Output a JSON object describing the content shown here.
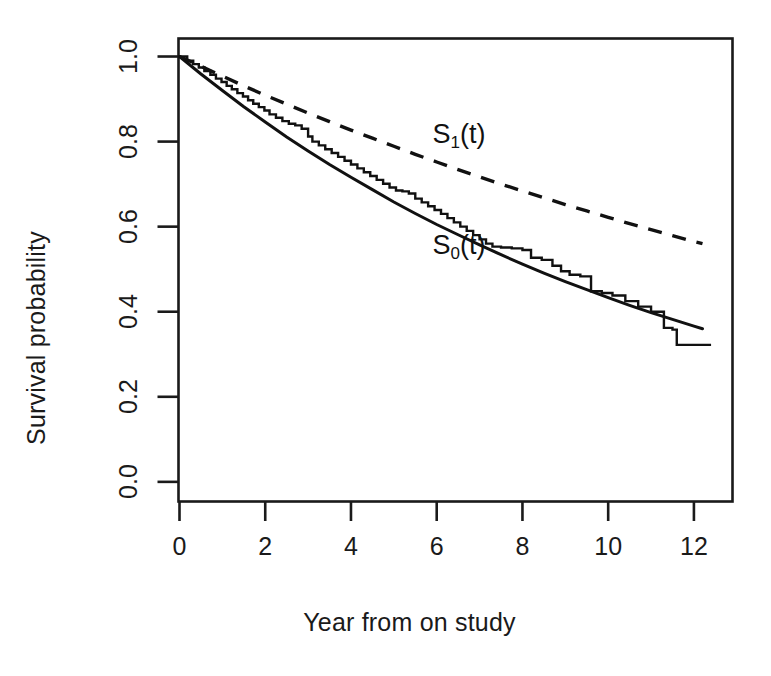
{
  "figure": {
    "background": "#ffffff",
    "ink_color": "#1a1a1a"
  },
  "axes": {
    "x_title": "Year from on study",
    "y_title": "Survival probability",
    "x_ticks": [
      "0",
      "2",
      "4",
      "6",
      "8",
      "10",
      "12"
    ],
    "y_ticks": [
      "0.0",
      "0.2",
      "0.4",
      "0.6",
      "0.8",
      "1.0"
    ]
  },
  "annotations": {
    "s1_label_base": "S",
    "s1_label_sub": "1",
    "s1_label_tail": "(t)",
    "s0_label_base": "S",
    "s0_label_sub": "0",
    "s0_label_tail": "(t)"
  },
  "chart_data": {
    "type": "line",
    "title": "",
    "xlabel": "Year from on study",
    "ylabel": "Survival probability",
    "xlim": [
      0,
      12.9
    ],
    "ylim": [
      -0.045,
      1.04
    ],
    "x_ticks": [
      0,
      2,
      4,
      6,
      8,
      10,
      12
    ],
    "y_ticks": [
      0.0,
      0.2,
      0.4,
      0.6,
      0.8,
      1.0
    ],
    "grid": false,
    "legend": "none",
    "box": true,
    "series": [
      {
        "name": "S1(t)",
        "style": "dashed",
        "color": "#111111",
        "label": "S_1(t)",
        "label_position": {
          "x": 5.9,
          "y": 0.805
        },
        "x": [
          0,
          0.5,
          1,
          1.5,
          2,
          2.5,
          3,
          3.5,
          4,
          4.5,
          5,
          5.5,
          6,
          6.5,
          7,
          7.5,
          8,
          8.5,
          9,
          9.5,
          10,
          10.5,
          11,
          11.5,
          12,
          12.2
        ],
        "y": [
          1.0,
          0.977,
          0.954,
          0.931,
          0.909,
          0.888,
          0.867,
          0.847,
          0.827,
          0.808,
          0.789,
          0.77,
          0.752,
          0.734,
          0.717,
          0.7,
          0.684,
          0.668,
          0.652,
          0.637,
          0.622,
          0.607,
          0.593,
          0.579,
          0.565,
          0.56
        ]
      },
      {
        "name": "S0(t)",
        "style": "solid",
        "color": "#111111",
        "label": "S_0(t)",
        "label_position": {
          "x": 5.9,
          "y": 0.545
        },
        "x": [
          0,
          0.5,
          1,
          1.5,
          2,
          2.5,
          3,
          3.5,
          4,
          4.5,
          5,
          5.5,
          6,
          6.5,
          7,
          7.5,
          8,
          8.5,
          9,
          9.5,
          10,
          10.5,
          11,
          11.5,
          12,
          12.2
        ],
        "y": [
          1.0,
          0.959,
          0.92,
          0.882,
          0.846,
          0.811,
          0.778,
          0.746,
          0.716,
          0.687,
          0.658,
          0.631,
          0.605,
          0.581,
          0.557,
          0.534,
          0.512,
          0.491,
          0.471,
          0.452,
          0.433,
          0.415,
          0.398,
          0.382,
          0.366,
          0.36
        ]
      },
      {
        "name": "Kaplan-Meier estimate",
        "style": "step",
        "color": "#111111",
        "x": [
          0,
          0.18,
          0.32,
          0.45,
          0.58,
          0.72,
          0.85,
          0.98,
          1.1,
          1.22,
          1.35,
          1.48,
          1.6,
          1.72,
          1.85,
          1.98,
          2.1,
          2.25,
          2.4,
          2.55,
          2.7,
          2.85,
          3.0,
          3.1,
          3.25,
          3.4,
          3.55,
          3.7,
          3.85,
          4.0,
          4.15,
          4.3,
          4.45,
          4.6,
          4.75,
          4.9,
          5.05,
          5.2,
          5.35,
          5.5,
          5.65,
          5.8,
          5.95,
          6.1,
          6.25,
          6.4,
          6.55,
          6.7,
          6.85,
          7.0,
          7.15,
          7.3,
          7.5,
          7.75,
          8.0,
          8.2,
          8.45,
          8.7,
          8.9,
          9.1,
          9.35,
          9.6,
          9.85,
          10.1,
          10.4,
          10.7,
          11.0,
          11.3,
          11.5,
          11.6,
          12.4
        ],
        "y": [
          1.0,
          0.99,
          0.982,
          0.974,
          0.966,
          0.957,
          0.948,
          0.94,
          0.931,
          0.923,
          0.914,
          0.906,
          0.897,
          0.889,
          0.881,
          0.873,
          0.864,
          0.856,
          0.848,
          0.842,
          0.838,
          0.83,
          0.812,
          0.8,
          0.791,
          0.782,
          0.773,
          0.764,
          0.755,
          0.746,
          0.737,
          0.728,
          0.719,
          0.71,
          0.701,
          0.692,
          0.685,
          0.683,
          0.678,
          0.666,
          0.657,
          0.648,
          0.639,
          0.63,
          0.62,
          0.61,
          0.6,
          0.59,
          0.58,
          0.57,
          0.56,
          0.553,
          0.551,
          0.549,
          0.545,
          0.527,
          0.522,
          0.508,
          0.495,
          0.487,
          0.483,
          0.448,
          0.444,
          0.438,
          0.425,
          0.412,
          0.4,
          0.362,
          0.358,
          0.322,
          0.322
        ]
      }
    ]
  }
}
